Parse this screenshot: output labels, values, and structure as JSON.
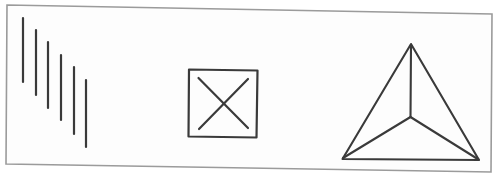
{
  "canvas": {
    "width": 499,
    "height": 179,
    "page_background": "#ffffff",
    "frame": {
      "fill": "#fdfdfd",
      "stroke": "#9b9b9b",
      "stroke_width": 1.6,
      "corners": [
        [
          7,
          5
        ],
        [
          492,
          14
        ],
        [
          491,
          172
        ],
        [
          6,
          164
        ]
      ]
    }
  },
  "figures": [
    {
      "name": "descending-vertical-lines-figure",
      "description": "six parallel vertical strokes stepping down from left to right",
      "stroke": "#3a3a3a",
      "stroke_width": 2.2,
      "linecap": "round",
      "lines": [
        [
          23,
          18,
          23,
          82
        ],
        [
          36,
          30,
          36,
          95
        ],
        [
          48,
          42,
          48,
          108
        ],
        [
          61,
          55,
          61,
          120
        ],
        [
          74,
          67,
          74,
          134
        ],
        [
          86,
          80,
          86,
          147
        ]
      ]
    },
    {
      "name": "crossed-square-figure",
      "description": "square outline with an X drawn inside, slightly inset from the corners",
      "stroke": "#3a3a3a",
      "stroke_width": 2.2,
      "linecap": "round",
      "polygons": [
        [
          [
            189,
            69.5
          ],
          [
            257.5,
            70.5
          ],
          [
            256.5,
            137.5
          ],
          [
            188.5,
            136.5
          ]
        ]
      ],
      "lines": [
        [
          198.5,
          78,
          248,
          128
        ],
        [
          248,
          79,
          199,
          129
        ]
      ]
    },
    {
      "name": "tetrahedron-triangle-figure",
      "description": "triangle with internal edges joining each vertex to a central point (wireframe tetrahedron)",
      "stroke": "#3a3a3a",
      "stroke_width": 2.1,
      "linecap": "round",
      "polygons": [
        [
          [
            411,
            44
          ],
          [
            479,
            160
          ],
          [
            342.5,
            159
          ]
        ]
      ],
      "lines": [
        [
          411,
          45,
          410.5,
          117
        ],
        [
          410.5,
          117,
          343,
          158
        ],
        [
          410.5,
          117,
          478.5,
          159.5
        ]
      ]
    }
  ]
}
